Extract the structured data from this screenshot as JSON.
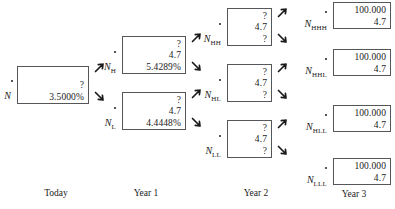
{
  "diagram": {
    "box_border_color": "#55565a",
    "text_color": "#1a1a1a"
  },
  "timeline": [
    {
      "label": "Today",
      "x": 16,
      "width": 80
    },
    {
      "label": "Year 1",
      "x": 106,
      "width": 80
    },
    {
      "label": "Year 2",
      "x": 216,
      "width": 80
    },
    {
      "label": "Year 3",
      "x": 318,
      "width": 72
    }
  ],
  "nodes": [
    {
      "id": "N",
      "base": "N",
      "sub": "",
      "column": "today",
      "box": {
        "x": 17,
        "y": 66,
        "w": 72,
        "h": 38
      },
      "label": {
        "x": 0,
        "y": 91
      },
      "dot": {
        "x": 11,
        "y": 80
      },
      "rows": [
        {
          "name": "price-cell",
          "value": "?"
        },
        {
          "name": "rate-cell",
          "value": "3.5000%"
        }
      ]
    },
    {
      "id": "N_H",
      "base": "N",
      "sub": "H",
      "column": "year1",
      "box": {
        "x": 122,
        "y": 36,
        "w": 64,
        "h": 38
      },
      "label": {
        "x": 99,
        "y": 62
      },
      "dot": {
        "x": 114,
        "y": 51
      },
      "rows": [
        {
          "name": "price-cell",
          "value": "?"
        },
        {
          "name": "coupon-cell",
          "value": "4.7"
        },
        {
          "name": "rate-cell",
          "value": "5.4289%"
        }
      ]
    },
    {
      "id": "N_L",
      "base": "N",
      "sub": "L",
      "column": "year1",
      "box": {
        "x": 122,
        "y": 92,
        "w": 64,
        "h": 38
      },
      "label": {
        "x": 99,
        "y": 118
      },
      "dot": {
        "x": 114,
        "y": 107
      },
      "rows": [
        {
          "name": "price-cell",
          "value": "?"
        },
        {
          "name": "coupon-cell",
          "value": "4.7"
        },
        {
          "name": "rate-cell",
          "value": "4.4448%"
        }
      ]
    },
    {
      "id": "N_HH",
      "base": "N",
      "sub": "HH",
      "column": "year2",
      "box": {
        "x": 227,
        "y": 8,
        "w": 45,
        "h": 38
      },
      "label": {
        "x": 197,
        "y": 34
      },
      "dot": {
        "x": 219,
        "y": 23
      },
      "rows": [
        {
          "name": "price-cell",
          "value": "?"
        },
        {
          "name": "coupon-cell",
          "value": "4.7"
        },
        {
          "name": "rate-cell",
          "value": "?"
        }
      ]
    },
    {
      "id": "N_HL",
      "base": "N",
      "sub": "HL",
      "column": "year2",
      "box": {
        "x": 227,
        "y": 64,
        "w": 45,
        "h": 38
      },
      "label": {
        "x": 197,
        "y": 90
      },
      "dot": {
        "x": 219,
        "y": 79
      },
      "rows": [
        {
          "name": "price-cell",
          "value": "?"
        },
        {
          "name": "coupon-cell",
          "value": "4.7"
        },
        {
          "name": "rate-cell",
          "value": "?"
        }
      ]
    },
    {
      "id": "N_LL",
      "base": "N",
      "sub": "LL",
      "column": "year2",
      "box": {
        "x": 227,
        "y": 120,
        "w": 45,
        "h": 38
      },
      "label": {
        "x": 197,
        "y": 146
      },
      "dot": {
        "x": 219,
        "y": 135
      },
      "rows": [
        {
          "name": "price-cell",
          "value": "?"
        },
        {
          "name": "coupon-cell",
          "value": "4.7"
        },
        {
          "name": "rate-cell",
          "value": "?"
        }
      ]
    },
    {
      "id": "N_HHH",
      "base": "N",
      "sub": "HHH",
      "column": "year3",
      "box": {
        "x": 333,
        "y": 2,
        "w": 58,
        "h": 27
      },
      "label": {
        "x": 296,
        "y": 19
      },
      "dot": {
        "x": 325,
        "y": 11
      },
      "rows": [
        {
          "name": "redemption-cell",
          "value": "100.000"
        },
        {
          "name": "coupon-cell",
          "value": "4.7"
        }
      ]
    },
    {
      "id": "N_HHL",
      "base": "N",
      "sub": "HHL",
      "column": "year3",
      "box": {
        "x": 333,
        "y": 49,
        "w": 58,
        "h": 27
      },
      "label": {
        "x": 296,
        "y": 66
      },
      "dot": {
        "x": 325,
        "y": 58
      },
      "rows": [
        {
          "name": "redemption-cell",
          "value": "100.000"
        },
        {
          "name": "coupon-cell",
          "value": "4.7"
        }
      ]
    },
    {
      "id": "N_HLL",
      "base": "N",
      "sub": "HLL",
      "column": "year3",
      "box": {
        "x": 333,
        "y": 105,
        "w": 58,
        "h": 27
      },
      "label": {
        "x": 296,
        "y": 122
      },
      "dot": {
        "x": 325,
        "y": 114
      },
      "rows": [
        {
          "name": "redemption-cell",
          "value": "100.000"
        },
        {
          "name": "coupon-cell",
          "value": "4.7"
        }
      ]
    },
    {
      "id": "N_LLL",
      "base": "N",
      "sub": "LLL",
      "column": "year3",
      "box": {
        "x": 333,
        "y": 158,
        "w": 58,
        "h": 27
      },
      "label": {
        "x": 296,
        "y": 175
      },
      "dot": {
        "x": 325,
        "y": 167
      },
      "rows": [
        {
          "name": "redemption-cell",
          "value": "100.000"
        },
        {
          "name": "coupon-cell",
          "value": "4.7"
        }
      ]
    }
  ],
  "arrows": [
    {
      "name": "arrow-N-to-NH",
      "dir": "up",
      "x": 93,
      "y": 61
    },
    {
      "name": "arrow-N-to-NL",
      "dir": "down",
      "x": 93,
      "y": 90
    },
    {
      "name": "arrow-NH-to-NHH",
      "dir": "up",
      "x": 190,
      "y": 31
    },
    {
      "name": "arrow-NH-to-NHL",
      "dir": "down",
      "x": 190,
      "y": 60
    },
    {
      "name": "arrow-NL-to-NHL",
      "dir": "up",
      "x": 190,
      "y": 87
    },
    {
      "name": "arrow-NL-to-NLL",
      "dir": "down",
      "x": 190,
      "y": 116
    },
    {
      "name": "arrow-NHH-to-NHHH",
      "dir": "up",
      "x": 276,
      "y": 6
    },
    {
      "name": "arrow-NHH-to-NHHL",
      "dir": "down",
      "x": 276,
      "y": 32
    },
    {
      "name": "arrow-NHL-to-NHHL",
      "dir": "up",
      "x": 276,
      "y": 61
    },
    {
      "name": "arrow-NHL-to-NHLL",
      "dir": "down",
      "x": 276,
      "y": 88
    },
    {
      "name": "arrow-NLL-to-NHLL",
      "dir": "up",
      "x": 276,
      "y": 117
    },
    {
      "name": "arrow-NLL-to-NLLL",
      "dir": "down",
      "x": 276,
      "y": 144
    }
  ],
  "captions": {
    "today": "Today",
    "year1": "Year 1",
    "year2": "Year 2",
    "year3": "Year 3"
  }
}
